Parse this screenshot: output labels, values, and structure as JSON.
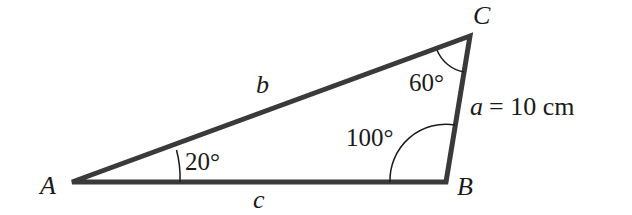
{
  "diagram": {
    "type": "triangle",
    "vertices": {
      "A": {
        "label": "A",
        "x": 72,
        "y": 182
      },
      "B": {
        "label": "B",
        "x": 446,
        "y": 182
      },
      "C": {
        "label": "C",
        "x": 470,
        "y": 36
      }
    },
    "sides": {
      "a": {
        "label": "a",
        "value_text": "= 10 cm"
      },
      "b": {
        "label": "b"
      },
      "c": {
        "label": "c"
      }
    },
    "angles": {
      "A": {
        "label": "20°"
      },
      "B": {
        "label": "100°"
      },
      "C": {
        "label": "60°"
      }
    },
    "colors": {
      "stroke": "#3a3a3a",
      "text": "#1a1a1a",
      "background": "#ffffff"
    }
  }
}
